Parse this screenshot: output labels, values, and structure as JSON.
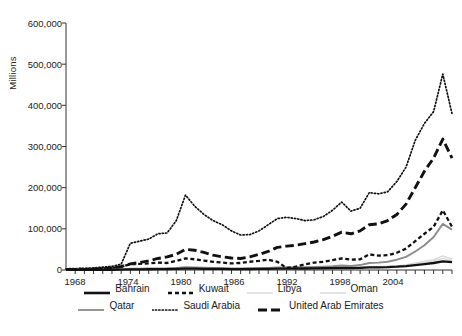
{
  "axes": {
    "ylabel": "Millions",
    "yticks": [
      "0",
      "100,000",
      "200,000",
      "300,000",
      "400,000",
      "500,000",
      "600,000"
    ],
    "xticks": [
      "1968",
      "1974",
      "1980",
      "1986",
      "1992",
      "1998",
      "2004"
    ],
    "ylim": [
      0,
      600000
    ],
    "xlim": [
      1967,
      2009
    ]
  },
  "legend": {
    "row1": [
      {
        "label": "Bahrain",
        "style": "solid-bold",
        "color": "#111111"
      },
      {
        "label": "Kuwait",
        "style": "short-dash",
        "color": "#111111"
      },
      {
        "label": "Libya",
        "style": "solid-faint",
        "color": "#dcdcdc"
      },
      {
        "label": "Oman",
        "style": "solid-faint",
        "color": "#dcdcdc"
      }
    ],
    "row2": [
      {
        "label": "Qatar",
        "style": "solid-gray",
        "color": "#8c8c8c"
      },
      {
        "label": "Saudi Arabia",
        "style": "dotted",
        "color": "#111111"
      },
      {
        "label": "United Arab Emirates",
        "style": "long-dash",
        "color": "#111111"
      }
    ]
  },
  "chart_data": {
    "type": "line",
    "title": "",
    "xlabel": "",
    "ylabel": "Millions",
    "xlim": [
      1967,
      2009
    ],
    "ylim": [
      0,
      600000
    ],
    "grid": false,
    "legend_position": "bottom",
    "x": [
      1967,
      1968,
      1969,
      1970,
      1971,
      1972,
      1973,
      1974,
      1975,
      1976,
      1977,
      1978,
      1979,
      1980,
      1981,
      1982,
      1983,
      1984,
      1985,
      1986,
      1987,
      1988,
      1989,
      1990,
      1991,
      1992,
      1993,
      1994,
      1995,
      1996,
      1997,
      1998,
      1999,
      2000,
      2001,
      2002,
      2003,
      2004,
      2005,
      2006,
      2007,
      2008,
      2009
    ],
    "series": [
      {
        "name": "Saudi Arabia",
        "style": "dotted",
        "color": "#111111",
        "values": [
          3000,
          3500,
          4000,
          5000,
          7000,
          9000,
          14000,
          65000,
          70000,
          75000,
          88000,
          90000,
          120000,
          182000,
          155000,
          135000,
          120000,
          110000,
          95000,
          85000,
          86000,
          95000,
          110000,
          125000,
          128000,
          125000,
          120000,
          122000,
          130000,
          145000,
          165000,
          143000,
          150000,
          188000,
          185000,
          190000,
          215000,
          250000,
          315000,
          356000,
          385000,
          476000,
          380000
        ]
      },
      {
        "name": "United Arab Emirates",
        "style": "long-dash",
        "color": "#111111",
        "values": [
          1000,
          1200,
          1500,
          2000,
          3000,
          5000,
          8000,
          15000,
          18000,
          22000,
          28000,
          32000,
          38000,
          50000,
          48000,
          43000,
          36000,
          32000,
          29000,
          28000,
          32000,
          38000,
          45000,
          55000,
          58000,
          60000,
          64000,
          68000,
          74000,
          82000,
          92000,
          88000,
          95000,
          110000,
          112000,
          120000,
          135000,
          160000,
          200000,
          240000,
          272000,
          318000,
          272000
        ]
      },
      {
        "name": "Kuwait",
        "style": "short-dash",
        "color": "#111111",
        "values": [
          2000,
          2300,
          2600,
          3000,
          4000,
          5500,
          8000,
          14000,
          15000,
          16000,
          18000,
          17000,
          22000,
          28000,
          26000,
          23000,
          20000,
          18000,
          16000,
          17000,
          20000,
          22000,
          25000,
          20000,
          5000,
          8000,
          14000,
          18000,
          20000,
          24000,
          28000,
          25000,
          26000,
          38000,
          35000,
          36000,
          42000,
          52000,
          70000,
          88000,
          105000,
          145000,
          105000
        ]
      },
      {
        "name": "Qatar",
        "style": "solid-gray",
        "color": "#8c8c8c",
        "values": [
          300,
          350,
          400,
          500,
          700,
          900,
          1400,
          3000,
          3200,
          3500,
          4000,
          4200,
          5000,
          6500,
          6200,
          5600,
          5000,
          4500,
          4000,
          3800,
          4000,
          4500,
          5200,
          6000,
          6200,
          6500,
          6800,
          7200,
          8000,
          9000,
          11000,
          10000,
          12000,
          17000,
          18000,
          20000,
          25000,
          32000,
          45000,
          60000,
          80000,
          112000,
          98000
        ]
      },
      {
        "name": "Bahrain",
        "style": "solid-bold",
        "color": "#111111",
        "values": [
          200,
          250,
          300,
          350,
          450,
          600,
          900,
          1600,
          1700,
          1800,
          2000,
          2200,
          2600,
          3200,
          3100,
          2900,
          2700,
          2500,
          2300,
          2200,
          2400,
          2600,
          2900,
          3200,
          3300,
          3400,
          3600,
          3800,
          4200,
          4600,
          5200,
          4800,
          5200,
          6500,
          6600,
          7000,
          8000,
          9500,
          12000,
          14500,
          17000,
          21000,
          19000
        ]
      },
      {
        "name": "Libya",
        "style": "solid-faint",
        "color": "#dcdcdc",
        "values": [
          400,
          450,
          500,
          600,
          800,
          1000,
          1500,
          2600,
          2500,
          2800,
          3200,
          3300,
          4000,
          5000,
          4600,
          4000,
          3400,
          3100,
          2800,
          2600,
          2800,
          3000,
          3400,
          4000,
          4100,
          4000,
          4200,
          4400,
          4800,
          5400,
          6200,
          5600,
          6200,
          8500,
          8200,
          8600,
          10000,
          13000,
          17000,
          21000,
          25000,
          34000,
          26000
        ]
      },
      {
        "name": "Oman",
        "style": "solid-faint",
        "color": "#dcdcdc",
        "values": [
          250,
          300,
          350,
          420,
          550,
          700,
          1000,
          1900,
          2000,
          2200,
          2500,
          2600,
          3100,
          4000,
          3800,
          3500,
          3200,
          3000,
          2700,
          2500,
          2700,
          3000,
          3300,
          3800,
          3900,
          3900,
          4100,
          4300,
          4700,
          5200,
          5900,
          5400,
          5900,
          7800,
          7600,
          8000,
          9200,
          11500,
          15000,
          18500,
          22000,
          28000,
          22000
        ]
      }
    ]
  }
}
